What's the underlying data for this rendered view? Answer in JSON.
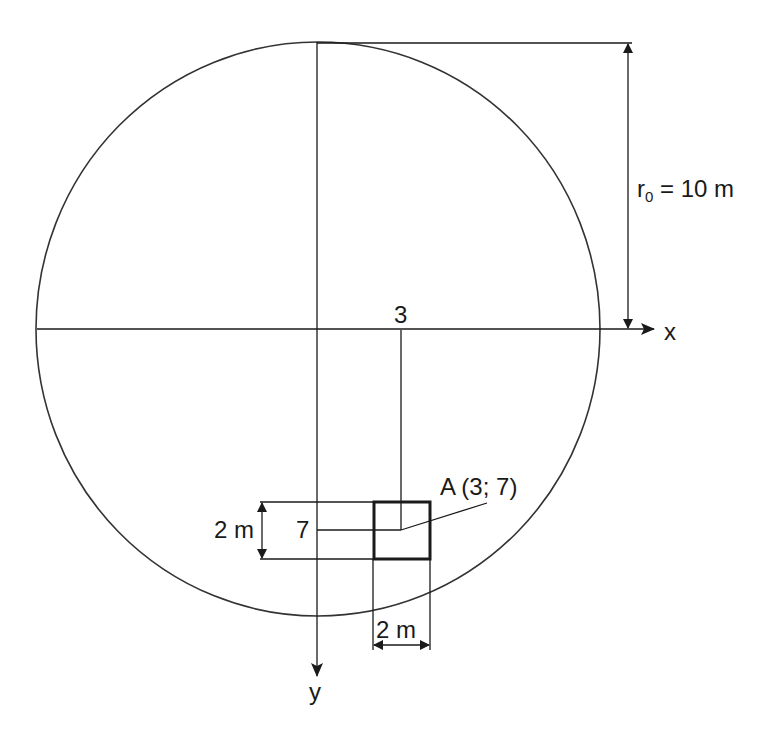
{
  "diagram": {
    "type": "geometry-figure",
    "circle": {
      "radius_label": "r",
      "radius_subscript": "0",
      "radius_value": " = 10 m"
    },
    "axes": {
      "x_label": "x",
      "y_label": "y"
    },
    "point": {
      "label": "A (3; 7)",
      "x_value": "3",
      "y_value": "7"
    },
    "square": {
      "width_label": "2 m",
      "height_label": "2 m"
    },
    "colors": {
      "stroke": "#1a1a1a",
      "background": "#ffffff"
    }
  }
}
